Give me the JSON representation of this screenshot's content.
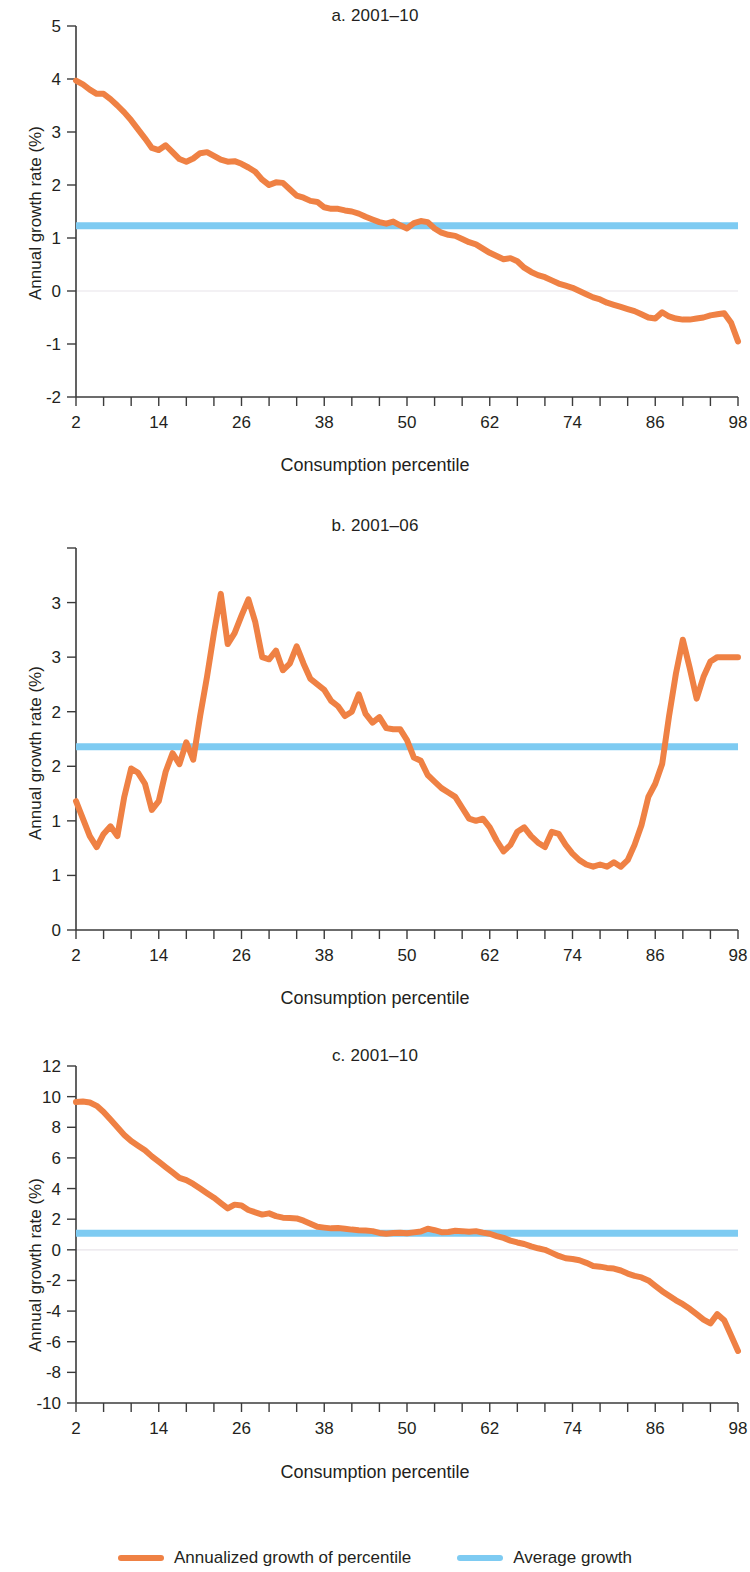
{
  "figure": {
    "axis_x_label": "Consumption percentile",
    "axis_y_label": "Annual growth rate (%)",
    "legend": {
      "series_label": "Annualized growth of percentile",
      "average_label": "Average growth",
      "series_color": "#ef8144",
      "average_color": "#7ecbf2"
    }
  },
  "chart_data": [
    {
      "type": "line",
      "title": "a. 2001–10",
      "xlabel": "Consumption percentile",
      "ylabel": "Annual growth rate (%)",
      "xlim": [
        2,
        98
      ],
      "ylim": [
        -2,
        5
      ],
      "xticks": [
        2,
        14,
        26,
        38,
        50,
        62,
        74,
        86,
        98
      ],
      "yticks": [
        -2,
        -1,
        0,
        1,
        2,
        3,
        4,
        5
      ],
      "grid": false,
      "legend_position": "below-figure",
      "series": [
        {
          "name": "Annualized growth of percentile",
          "color": "#ef8144",
          "x": [
            2,
            3,
            4,
            5,
            6,
            7,
            8,
            9,
            10,
            11,
            12,
            13,
            14,
            15,
            16,
            17,
            18,
            19,
            20,
            21,
            22,
            23,
            24,
            25,
            26,
            27,
            28,
            29,
            30,
            31,
            32,
            33,
            34,
            35,
            36,
            37,
            38,
            39,
            40,
            41,
            42,
            43,
            44,
            45,
            46,
            47,
            48,
            49,
            50,
            51,
            52,
            53,
            54,
            55,
            56,
            57,
            58,
            59,
            60,
            61,
            62,
            63,
            64,
            65,
            66,
            67,
            68,
            69,
            70,
            71,
            72,
            73,
            74,
            75,
            76,
            77,
            78,
            79,
            80,
            81,
            82,
            83,
            84,
            85,
            86,
            87,
            88,
            89,
            90,
            91,
            92,
            93,
            94,
            95,
            96,
            97,
            98
          ],
          "values": [
            3.97,
            3.9,
            3.8,
            3.72,
            3.72,
            3.62,
            3.5,
            3.37,
            3.22,
            3.05,
            2.88,
            2.7,
            2.66,
            2.75,
            2.62,
            2.49,
            2.44,
            2.5,
            2.6,
            2.62,
            2.55,
            2.48,
            2.44,
            2.45,
            2.4,
            2.33,
            2.25,
            2.1,
            2.0,
            2.05,
            2.04,
            1.92,
            1.8,
            1.76,
            1.7,
            1.68,
            1.58,
            1.55,
            1.55,
            1.52,
            1.5,
            1.46,
            1.4,
            1.35,
            1.3,
            1.27,
            1.31,
            1.24,
            1.18,
            1.28,
            1.32,
            1.3,
            1.18,
            1.1,
            1.06,
            1.04,
            0.98,
            0.92,
            0.88,
            0.8,
            0.72,
            0.66,
            0.6,
            0.62,
            0.56,
            0.44,
            0.36,
            0.3,
            0.26,
            0.2,
            0.14,
            0.1,
            0.06,
            0.0,
            -0.06,
            -0.12,
            -0.16,
            -0.22,
            -0.26,
            -0.3,
            -0.34,
            -0.38,
            -0.44,
            -0.5,
            -0.52,
            -0.4,
            -0.48,
            -0.52,
            -0.54,
            -0.54,
            -0.52,
            -0.5,
            -0.46,
            -0.44,
            -0.42,
            -0.6,
            -0.95,
            -1.3,
            -1.65
          ]
        },
        {
          "name": "Average growth",
          "color": "#7ecbf2",
          "value": 1.23
        }
      ]
    },
    {
      "type": "line",
      "title": "b. 2001–06",
      "xlabel": "Consumption percentile",
      "ylabel": "Annual growth rate (%)",
      "xlim": [
        2,
        98
      ],
      "ylim": [
        0,
        3.5
      ],
      "xticks": [
        2,
        14,
        26,
        38,
        50,
        62,
        74,
        86,
        98
      ],
      "yticks": [
        0,
        1,
        1,
        2,
        2,
        3,
        3
      ],
      "ytick_values": [
        0,
        0.5,
        1.0,
        1.5,
        2.0,
        2.5,
        3.0,
        3.5
      ],
      "ytick_labels": [
        "0",
        "1",
        "1",
        "2",
        "2",
        "3",
        "3"
      ],
      "grid": false,
      "legend_position": "below-figure",
      "series": [
        {
          "name": "Annualized growth of percentile",
          "color": "#ef8144",
          "x": [
            2,
            3,
            4,
            5,
            6,
            7,
            8,
            9,
            10,
            11,
            12,
            13,
            14,
            15,
            16,
            17,
            18,
            19,
            20,
            21,
            22,
            23,
            24,
            25,
            26,
            27,
            28,
            29,
            30,
            31,
            32,
            33,
            34,
            35,
            36,
            37,
            38,
            39,
            40,
            41,
            42,
            43,
            44,
            45,
            46,
            47,
            48,
            49,
            50,
            51,
            52,
            53,
            54,
            55,
            56,
            57,
            58,
            59,
            60,
            61,
            62,
            63,
            64,
            65,
            66,
            67,
            68,
            69,
            70,
            71,
            72,
            73,
            74,
            75,
            76,
            77,
            78,
            79,
            80,
            81,
            82,
            83,
            84,
            85,
            86,
            87,
            88,
            89,
            90,
            91,
            92,
            93,
            94,
            95,
            96,
            97,
            98
          ],
          "values": [
            1.18,
            1.02,
            0.86,
            0.76,
            0.88,
            0.95,
            0.86,
            1.22,
            1.48,
            1.44,
            1.34,
            1.1,
            1.18,
            1.45,
            1.62,
            1.52,
            1.72,
            1.56,
            1.96,
            2.32,
            2.72,
            3.08,
            2.62,
            2.72,
            2.88,
            3.03,
            2.82,
            2.5,
            2.48,
            2.56,
            2.38,
            2.44,
            2.6,
            2.44,
            2.3,
            2.25,
            2.2,
            2.1,
            2.05,
            1.96,
            2.0,
            2.16,
            1.98,
            1.9,
            1.95,
            1.85,
            1.84,
            1.84,
            1.74,
            1.58,
            1.55,
            1.42,
            1.36,
            1.3,
            1.26,
            1.22,
            1.12,
            1.02,
            1.0,
            1.02,
            0.94,
            0.82,
            0.72,
            0.78,
            0.9,
            0.94,
            0.86,
            0.8,
            0.76,
            0.9,
            0.88,
            0.78,
            0.7,
            0.64,
            0.6,
            0.58,
            0.6,
            0.58,
            0.62,
            0.58,
            0.64,
            0.78,
            0.96,
            1.22,
            1.34,
            1.52,
            1.96,
            2.35,
            2.66,
            2.4,
            2.12,
            2.32,
            2.46,
            2.5,
            2.5,
            2.5,
            2.5
          ]
        },
        {
          "name": "Average growth",
          "color": "#7ecbf2",
          "value": 1.68
        }
      ]
    },
    {
      "type": "line",
      "title": "c. 2001–10",
      "xlabel": "Consumption percentile",
      "ylabel": "Annual growth rate (%)",
      "xlim": [
        2,
        98
      ],
      "ylim": [
        -10,
        12
      ],
      "xticks": [
        2,
        14,
        26,
        38,
        50,
        62,
        74,
        86,
        98
      ],
      "yticks": [
        -10,
        -8,
        -6,
        -4,
        -2,
        0,
        2,
        4,
        6,
        8,
        10,
        12
      ],
      "grid": false,
      "legend_position": "below-figure",
      "series": [
        {
          "name": "Annualized growth of percentile",
          "color": "#ef8144",
          "x": [
            2,
            3,
            4,
            5,
            6,
            7,
            8,
            9,
            10,
            11,
            12,
            13,
            14,
            15,
            16,
            17,
            18,
            19,
            20,
            21,
            22,
            23,
            24,
            25,
            26,
            27,
            28,
            29,
            30,
            31,
            32,
            33,
            34,
            35,
            36,
            37,
            38,
            39,
            40,
            41,
            42,
            43,
            44,
            45,
            46,
            47,
            48,
            49,
            50,
            51,
            52,
            53,
            54,
            55,
            56,
            57,
            58,
            59,
            60,
            61,
            62,
            63,
            64,
            65,
            66,
            67,
            68,
            69,
            70,
            71,
            72,
            73,
            74,
            75,
            76,
            77,
            78,
            79,
            80,
            81,
            82,
            83,
            84,
            85,
            86,
            87,
            88,
            89,
            90,
            91,
            92,
            93,
            94,
            95,
            96,
            97,
            98
          ],
          "values": [
            9.65,
            9.68,
            9.62,
            9.4,
            9.0,
            8.5,
            8.0,
            7.5,
            7.1,
            6.8,
            6.5,
            6.1,
            5.75,
            5.4,
            5.05,
            4.7,
            4.55,
            4.3,
            4.0,
            3.7,
            3.4,
            3.05,
            2.7,
            2.95,
            2.9,
            2.6,
            2.45,
            2.3,
            2.38,
            2.2,
            2.1,
            2.08,
            2.05,
            1.9,
            1.7,
            1.5,
            1.45,
            1.4,
            1.42,
            1.38,
            1.32,
            1.28,
            1.26,
            1.22,
            1.1,
            1.05,
            1.1,
            1.12,
            1.08,
            1.14,
            1.2,
            1.38,
            1.28,
            1.15,
            1.16,
            1.24,
            1.22,
            1.18,
            1.22,
            1.12,
            1.05,
            0.9,
            0.78,
            0.6,
            0.48,
            0.38,
            0.22,
            0.1,
            0.0,
            -0.2,
            -0.4,
            -0.55,
            -0.6,
            -0.68,
            -0.85,
            -1.05,
            -1.1,
            -1.18,
            -1.22,
            -1.35,
            -1.55,
            -1.7,
            -1.8,
            -2.0,
            -2.35,
            -2.7,
            -3.0,
            -3.3,
            -3.55,
            -3.85,
            -4.2,
            -4.55,
            -4.8,
            -4.2,
            -4.6,
            -5.6,
            -6.6,
            -7.5,
            -8.2
          ]
        },
        {
          "name": "Average growth",
          "color": "#7ecbf2",
          "value": 1.08
        }
      ]
    }
  ]
}
